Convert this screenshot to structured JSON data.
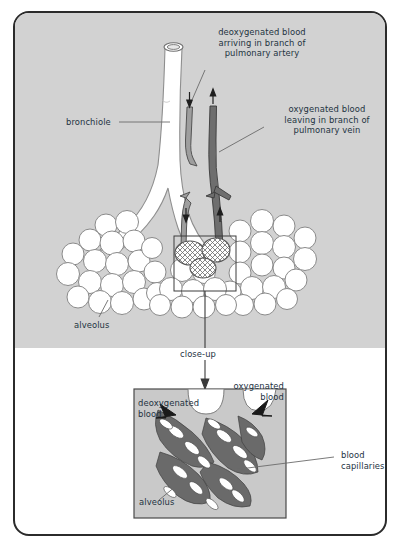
{
  "diagram": {
    "colors": {
      "panel_background": "#d2d2d2",
      "page_background": "#ffffff",
      "frame_stroke": "#2b2b2b",
      "text": "#23323f",
      "artery_fill": "#9a9a9a",
      "vein_fill": "#6e6e6e",
      "alveolus_fill": "#ffffff",
      "alveolus_stroke": "#8a8a8a",
      "capillary_dark": "#5d5d5d",
      "inset_background": "#c9c9c9",
      "leader_line": "#6b6b6b"
    },
    "top_panel": {
      "labels": [
        {
          "name": "deoxygenated-blood-label",
          "text": "deoxygenated blood\narriving in branch of\npulmonary artery"
        },
        {
          "name": "oxygenated-blood-label",
          "text": "oxygenated blood\nleaving in branch of\npulmonary vein"
        },
        {
          "name": "bronchiole-label",
          "text": "bronchiole"
        },
        {
          "name": "alveolus-label",
          "text": "alveolus"
        }
      ]
    },
    "connector": {
      "label": "close-up"
    },
    "bottom_panel": {
      "labels": [
        {
          "name": "inset-deoxygenated-label",
          "text": "deoxygenated\nblood"
        },
        {
          "name": "inset-oxygenated-label",
          "text": "oxygenated\nblood"
        },
        {
          "name": "blood-capillaries-label",
          "text": "blood\ncapillaries"
        },
        {
          "name": "inset-alveolus-label",
          "text": "alveolus"
        }
      ]
    }
  }
}
